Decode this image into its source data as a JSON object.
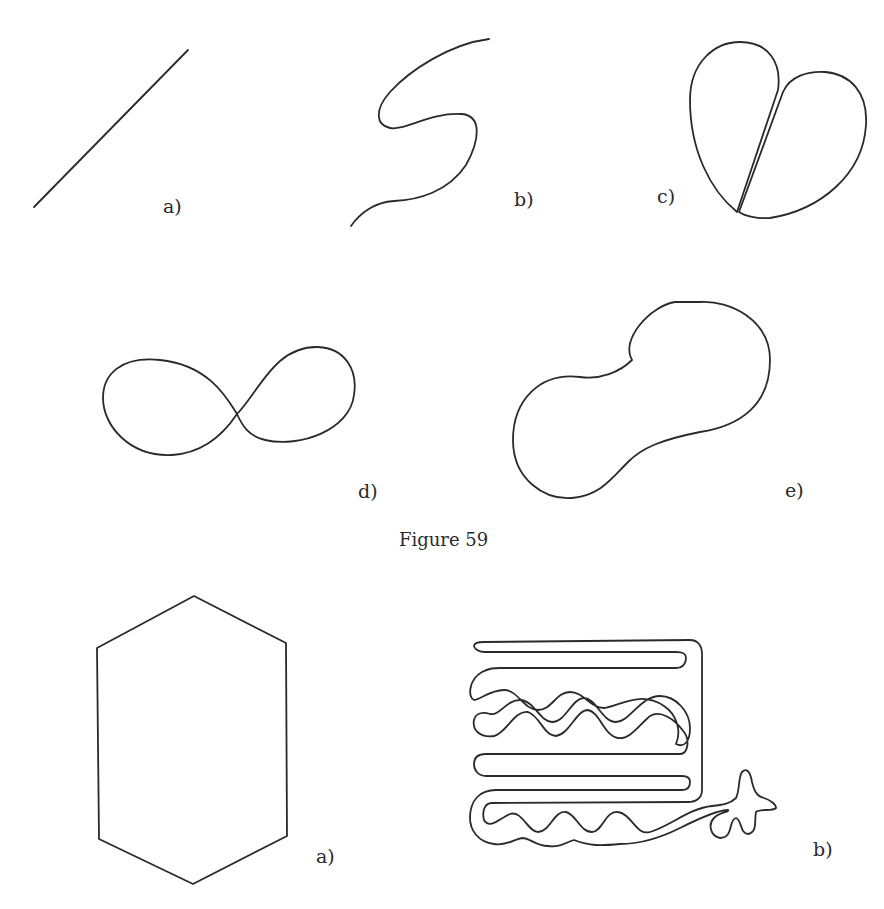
{
  "figure59": {
    "caption": "Figure 59",
    "panels": [
      {
        "id": "a",
        "label": "a)",
        "shape": "straight line segment"
      },
      {
        "id": "b",
        "label": "b)",
        "shape": "S-shaped open curve"
      },
      {
        "id": "c",
        "label": "c)",
        "shape": "two tangent loops (heart-like)"
      },
      {
        "id": "d",
        "label": "d)",
        "shape": "figure-eight (self-intersecting closed curve)"
      },
      {
        "id": "e",
        "label": "e)",
        "shape": "peanut-shaped simple closed curve"
      }
    ]
  },
  "figure60": {
    "panels": [
      {
        "id": "a",
        "label": "a)",
        "shape": "hexagon"
      },
      {
        "id": "b",
        "label": "b)",
        "shape": "convoluted simple closed curve (maze-like)"
      }
    ]
  },
  "colors": {
    "ink": "#2a2a2a",
    "paper": "#ffffff"
  }
}
